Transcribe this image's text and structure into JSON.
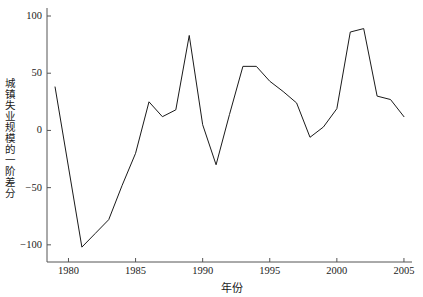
{
  "chart_data": {
    "type": "line",
    "title": "",
    "xlabel": "年份",
    "ylabel": "城镇失业规模的一阶差分",
    "xlim": [
      1978.4,
      2005.6
    ],
    "ylim": [
      -115,
      107
    ],
    "xticks": [
      1980,
      1985,
      1990,
      1995,
      2000,
      2005
    ],
    "xtick_labels": [
      "1980",
      "1985",
      "1990",
      "1995",
      "2000",
      "2005"
    ],
    "yticks": [
      -100,
      -50,
      0,
      50,
      100
    ],
    "ytick_labels": [
      "-100",
      "-50",
      "0",
      "50",
      "100"
    ],
    "grid": false,
    "legend": false,
    "line_color": "#1a1a1a",
    "line_width": 1,
    "x": [
      1979,
      1980,
      1981,
      1982,
      1983,
      1984,
      1985,
      1986,
      1987,
      1988,
      1989,
      1990,
      1991,
      1992,
      1993,
      1994,
      1995,
      1996,
      1997,
      1998,
      1999,
      2000,
      2001,
      2002,
      2003,
      2004,
      2005
    ],
    "values": [
      38,
      -32,
      -102,
      -90,
      -78,
      -48,
      -20,
      25,
      12,
      18,
      83,
      5,
      -30,
      14,
      56,
      56,
      43,
      34,
      24,
      -6,
      3,
      19,
      86,
      89,
      30,
      27,
      12
    ],
    "series": [
      {
        "name": "城镇失业规模的一阶差分",
        "values": [
          38,
          -32,
          -102,
          -90,
          -78,
          -48,
          -20,
          25,
          12,
          18,
          83,
          5,
          -30,
          14,
          56,
          56,
          43,
          34,
          24,
          -6,
          3,
          19,
          86,
          89,
          30,
          27,
          12
        ]
      }
    ]
  }
}
